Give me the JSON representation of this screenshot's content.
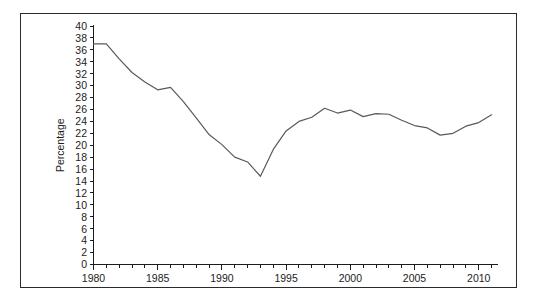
{
  "figure": {
    "frame_border_color": "#2b2b2b",
    "background_color": "#ffffff",
    "line_color": "#595959",
    "axis_color": "#1c1c1c"
  },
  "chart_data": {
    "type": "line",
    "title": "",
    "subtitle": "",
    "xlabel": "",
    "ylabel": "Percentage",
    "xlim": [
      1980,
      2011.5
    ],
    "ylim": [
      0,
      40
    ],
    "ytick_step": 2,
    "xtick_major_step": 5,
    "xtick_minor_step": 1,
    "grid": false,
    "legend": false,
    "legend_position": "none",
    "yticks": [
      0,
      2,
      4,
      6,
      8,
      10,
      12,
      14,
      16,
      18,
      20,
      22,
      24,
      26,
      28,
      30,
      32,
      34,
      36,
      38,
      40
    ],
    "ytick_labels": [
      "0",
      "2",
      "4",
      "6",
      "8",
      "10",
      "12",
      "14",
      "16",
      "18",
      "20",
      "22",
      "24",
      "26",
      "28",
      "30",
      "32",
      "34",
      "36",
      "38",
      "40"
    ],
    "xticks": [
      1980,
      1985,
      1990,
      1995,
      2000,
      2005,
      2010
    ],
    "xtick_labels": [
      "1980",
      "1985",
      "1990",
      "1995",
      "2000",
      "2005",
      "2010"
    ],
    "series": [
      {
        "name": "Percentage",
        "color": "#595959",
        "x": [
          1980,
          1981,
          1982,
          1983,
          1984,
          1985,
          1986,
          1987,
          1988,
          1989,
          1990,
          1991,
          1992,
          1993,
          1994,
          1995,
          1996,
          1997,
          1998,
          1999,
          2000,
          2001,
          2002,
          2003,
          2004,
          2005,
          2006,
          2007,
          2008,
          2009,
          2010,
          2011
        ],
        "values": [
          37.0,
          37.0,
          34.5,
          32.2,
          30.6,
          29.3,
          29.7,
          27.3,
          24.6,
          21.8,
          20.1,
          18.0,
          17.2,
          14.8,
          19.3,
          22.4,
          24.0,
          24.7,
          26.2,
          25.4,
          25.9,
          24.8,
          25.3,
          25.2,
          24.2,
          23.3,
          22.9,
          21.7,
          22.0,
          23.2,
          23.8,
          25.1
        ]
      }
    ]
  }
}
